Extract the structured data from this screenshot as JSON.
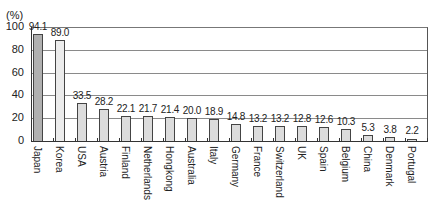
{
  "chart_data": {
    "type": "bar",
    "title": "",
    "xlabel": "",
    "ylabel": "(%)",
    "ylim": [
      0,
      100
    ],
    "yticks": [
      0,
      20,
      40,
      60,
      80,
      100
    ],
    "grid": true,
    "legend": null,
    "categories": [
      "Japan",
      "Korea",
      "USA",
      "Austria",
      "Finland",
      "Netherlands",
      "Hongkong",
      "Australia",
      "Italy",
      "Germany",
      "France",
      "Switzerland",
      "UK",
      "Spain",
      "Belgium",
      "China",
      "Denmark",
      "Portugal"
    ],
    "values": [
      94.1,
      89.0,
      33.5,
      28.2,
      22.1,
      21.7,
      21.4,
      20.0,
      18.9,
      14.8,
      13.2,
      13.2,
      12.8,
      12.6,
      10.3,
      5.3,
      3.8,
      2.2
    ],
    "value_labels": [
      "94.1",
      "89.0",
      "33.5",
      "28.2",
      "22.1",
      "21.7",
      "21.4",
      "20.0",
      "18.9",
      "14.8",
      "13.2",
      "13.2",
      "12.8",
      "12.6",
      "10.3",
      "5.3",
      "3.8",
      "2.2"
    ],
    "colors": {
      "highlight": "#b0b0b0",
      "secondary": "#ececec",
      "default": "#dcdcdc",
      "outline": "#444444",
      "grid": "#8a8a8a"
    }
  },
  "labels": {
    "unit": "(%)",
    "yticks": [
      "0",
      "20",
      "40",
      "60",
      "80",
      "100"
    ]
  }
}
